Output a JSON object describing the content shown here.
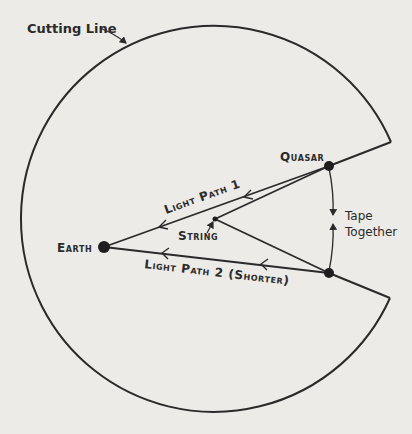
{
  "diagram": {
    "colors": {
      "background": "#ecebe8",
      "ink": "#2a2a2a"
    },
    "labels": {
      "cutting_line": "Cutting Line",
      "quasar": "Quasar",
      "earth": "Earth",
      "string": "String",
      "light_path_1": "Light Path 1",
      "light_path_2": "Light Path 2 (Shorter)",
      "tape_line1": "Tape",
      "tape_line2": "Together"
    },
    "nodes": [
      {
        "id": "earth",
        "label": "Earth"
      },
      {
        "id": "quasar",
        "label": "Quasar"
      },
      {
        "id": "quasar_image",
        "label": ""
      },
      {
        "id": "string",
        "label": "String"
      }
    ],
    "edges": [
      {
        "from": "quasar",
        "to": "earth",
        "label": "Light Path 1"
      },
      {
        "from": "quasar_image",
        "to": "earth",
        "label": "Light Path 2 (Shorter)"
      },
      {
        "from": "quasar",
        "to": "string",
        "label": ""
      },
      {
        "from": "string",
        "to": "quasar_image",
        "label": ""
      }
    ]
  }
}
